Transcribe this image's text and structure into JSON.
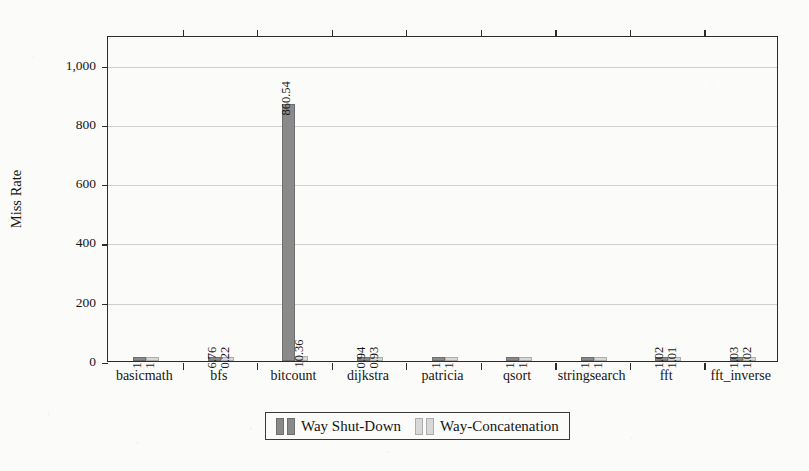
{
  "chart_data": {
    "type": "bar",
    "title": "",
    "subtitle": "",
    "xlabel": "",
    "ylabel": "Miss Rate",
    "ylim": [
      0,
      1100
    ],
    "yticks": [
      0,
      200,
      400,
      600,
      800,
      1000
    ],
    "ytick_labels": [
      "0",
      "200",
      "400",
      "600",
      "800",
      "1,000"
    ],
    "grid": "horizontal",
    "legend_position": "below-center",
    "bar_label_rotation": -90,
    "categories": [
      "basicmath",
      "bfs",
      "bitcount",
      "dijkstra",
      "patricia",
      "qsort",
      "stringsearch",
      "fft",
      "fft_inverse"
    ],
    "series": [
      {
        "name": "Way Shut-Down",
        "color": "#8a8a8a",
        "values": [
          1,
          6.76,
          860.54,
          0.94,
          1,
          1,
          1,
          1.02,
          1.03
        ],
        "labels": [
          "1",
          "6.76",
          "860.54",
          "0.94",
          "1",
          "1",
          "1",
          "1.02",
          "1.03"
        ]
      },
      {
        "name": "Way-Concatenation",
        "color": "#d8d8d8",
        "values": [
          1,
          0.22,
          10.36,
          0.93,
          1,
          1,
          1,
          1.01,
          1.02
        ],
        "labels": [
          "1",
          "0.22",
          "10.36",
          "0.93",
          "1",
          "1",
          "1",
          "1.01",
          "1.02"
        ]
      }
    ]
  },
  "legend": {
    "entries": [
      {
        "label": "Way Shut-Down"
      },
      {
        "label": "Way-Concatenation"
      }
    ]
  }
}
